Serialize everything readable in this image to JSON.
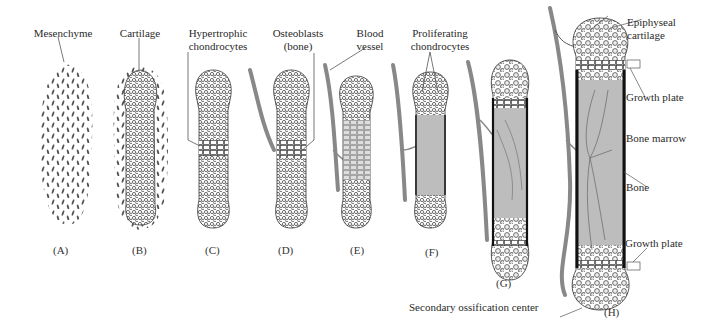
{
  "diagram": {
    "colors": {
      "ink": "#2a2a2a",
      "vessel": "#7a7a7a",
      "bone_fill": "#bdbdbd",
      "cortex": "#111111",
      "background": "#ffffff"
    },
    "panels": [
      {
        "id": "A",
        "label": "(A)",
        "stage": "Mesenchyme"
      },
      {
        "id": "B",
        "label": "(B)",
        "stage": "Cartilage"
      },
      {
        "id": "C",
        "label": "(C)",
        "stage": "Hypertrophic chondrocytes"
      },
      {
        "id": "D",
        "label": "(D)",
        "stage": "Osteoblasts (bone)"
      },
      {
        "id": "E",
        "label": "(E)",
        "stage": "Blood vessel"
      },
      {
        "id": "F",
        "label": "(F)",
        "stage": "Proliferating chondrocytes"
      },
      {
        "id": "G",
        "label": "(G)",
        "stage": "Vascularized shaft"
      },
      {
        "id": "H",
        "label": "(H)",
        "stage": "Mature long bone"
      }
    ],
    "callouts": {
      "mesenchyme": "Mesenchyme",
      "cartilage": "Cartilage",
      "hypertrophic_1": "Hypertrophic",
      "hypertrophic_2": "chondrocytes",
      "osteoblasts_1": "Osteoblasts",
      "osteoblasts_2": "(bone)",
      "blood_1": "Blood",
      "blood_2": "vessel",
      "proliferating_1": "Proliferating",
      "proliferating_2": "chondrocytes",
      "epiphyseal_1": "Epiphyseal",
      "epiphyseal_2": "cartilage",
      "growth_plate_top": "Growth plate",
      "bone_marrow": "Bone marrow",
      "bone": "Bone",
      "growth_plate_bottom": "Growth plate",
      "secondary_ossification": "Secondary ossification center"
    }
  }
}
